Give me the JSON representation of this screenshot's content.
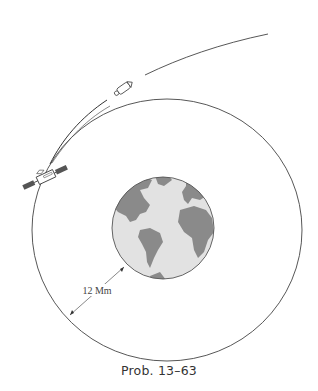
{
  "figure": {
    "caption": "Prob. 13–63",
    "dimension_label": "12 Mm",
    "colors": {
      "line": "#444444",
      "earth_ocean": "#e2e2e2",
      "earth_land": "#8a8a8a",
      "background": "#ffffff"
    },
    "elements": {
      "earth": "Earth globe showing the Americas, Africa and Europe",
      "circular_orbit": "Circular orbit around Earth",
      "satellite": "Satellite on circular orbit",
      "rocket": "Rocket on escape trajectory",
      "trajectory": "Departure trajectory curve"
    }
  }
}
